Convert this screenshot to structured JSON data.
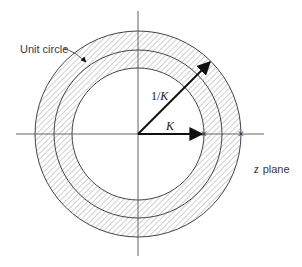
{
  "diagram": {
    "type": "z-plane region of convergence",
    "labels": {
      "unit_circle": "Unit circle",
      "plane": "plane",
      "plane_var": "z",
      "inner_vector": "K",
      "outer_vector_prefix": "1/",
      "outer_vector_var": "K"
    },
    "geometry": {
      "center": [
        138,
        134
      ],
      "inner_radius": 66,
      "unit_radius": 84,
      "outer_radius": 103,
      "h_axis": [
        16,
        264
      ],
      "v_axis": [
        11,
        256
      ]
    },
    "markers": {
      "pole_inner": "×",
      "pole_outer": "×"
    },
    "colors": {
      "stroke": "#444444",
      "hatch": "#8a8a8a",
      "arrow": "#111111",
      "text": "#333333"
    }
  }
}
